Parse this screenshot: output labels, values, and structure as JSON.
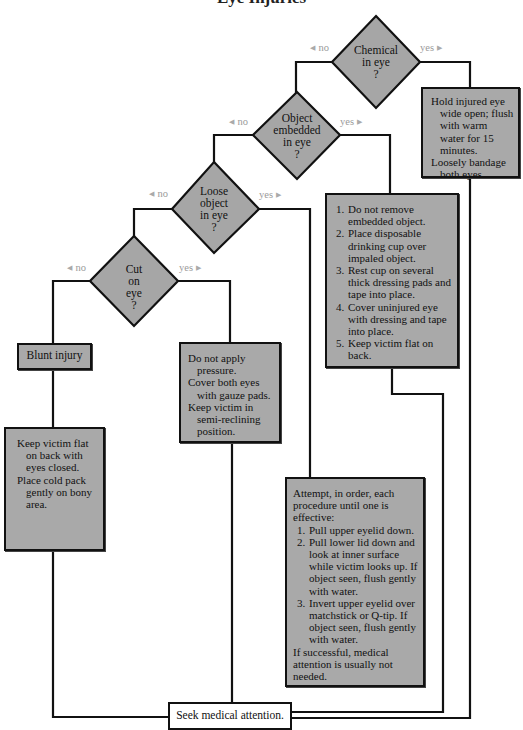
{
  "title": "Eye Injuries",
  "branches": {
    "no": "no",
    "yes": "yes"
  },
  "decisions": {
    "chemical": {
      "lines": [
        "Chemical",
        "in eye",
        "?"
      ]
    },
    "embedded": {
      "lines": [
        "Object",
        "embedded",
        "in eye",
        "?"
      ]
    },
    "loose": {
      "lines": [
        "Loose",
        "object",
        "in eye",
        "?"
      ]
    },
    "cut": {
      "lines": [
        "Cut",
        "on",
        "eye",
        "?"
      ]
    }
  },
  "actions": {
    "chemical_yes": {
      "paragraphs": [
        "Hold injured eye wide open; flush with warm water for 15 minutes.",
        "Loosely bandage both eyes."
      ]
    },
    "embedded_yes": {
      "steps": [
        "Do not remove embedded object.",
        "Place disposable drinking cup over impaled object.",
        "Rest cup on several thick dressing pads and tape into place.",
        "Cover uninjured eye with dressing and tape into place.",
        "Keep victim flat on back."
      ]
    },
    "loose_yes": {
      "intro": "Attempt, in order, each procedure until one is effective:",
      "steps": [
        "Pull upper eyelid down.",
        "Pull lower lid down and look at inner surface while victim looks up. If object seen, flush gently with water.",
        "Invert upper eyelid over matchstick or Q-tip. If object seen, flush gently with water."
      ],
      "outro": "If successful, medical attention is usually not needed."
    },
    "cut_yes": {
      "paragraphs": [
        "Do not apply pressure.",
        "Cover both eyes with gauze pads.",
        "Keep victim in semi-reclining position."
      ]
    },
    "blunt": {
      "label": "Blunt injury"
    },
    "blunt_care": {
      "paragraphs": [
        "Keep victim flat on back with eyes closed.",
        "Place cold pack gently on bony area."
      ]
    },
    "seek": {
      "label": "Seek medical attention."
    }
  },
  "colors": {
    "box_fill": "#a9a9a9",
    "line": "#111111",
    "branch_label": "#9a9a9a"
  }
}
